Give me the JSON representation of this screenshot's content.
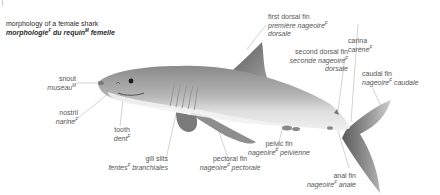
{
  "title": {
    "en": "morphology of a female shark",
    "fr_word1": "morphologie",
    "fr_word1_gender": "F",
    "fr_word2": " du requin",
    "fr_word2_gender": "M",
    "fr_word3": " femelle"
  },
  "labels": {
    "snout": {
      "en": "snout",
      "fr": "museau",
      "gender": "M"
    },
    "nostril": {
      "en": "nostril",
      "fr": "narine",
      "gender": "F"
    },
    "tooth": {
      "en": "tooth",
      "fr": "dent",
      "gender": "F"
    },
    "gill_slits": {
      "en": "gill slits",
      "fr": "fentes",
      "gender": "F",
      "fr_rest": " branchiales"
    },
    "pectoral_fin": {
      "en": "pectoral fin",
      "fr": "nageoire",
      "gender": "F",
      "fr_rest": " pectorale"
    },
    "pelvic_fin": {
      "en": "pelvic fin",
      "fr": "nageoire",
      "gender": "F",
      "fr_rest": " pelvienne"
    },
    "anal_fin": {
      "en": "anal fin",
      "fr": "nageoire",
      "gender": "F",
      "fr_rest": " anale"
    },
    "first_dorsal_fin": {
      "en": "first dorsal fin",
      "fr": "première nageoire",
      "gender": "F",
      "fr_line2": "dorsale"
    },
    "second_dorsal_fin": {
      "en": "second dorsal fin",
      "fr": "seconde nageoire",
      "gender": "F",
      "fr_line2": "dorsale"
    },
    "carina": {
      "en": "carina",
      "fr": "carène",
      "gender": "F"
    },
    "caudal_fin": {
      "en": "caudal fin",
      "fr": "nageoire",
      "gender": "F",
      "fr_rest": " caudale"
    }
  },
  "colors": {
    "shark_dark": "#6f6f6f",
    "shark_light": "#d9d9d9",
    "belly": "#f2f2f2",
    "leader_line": "#b5b5b5"
  }
}
